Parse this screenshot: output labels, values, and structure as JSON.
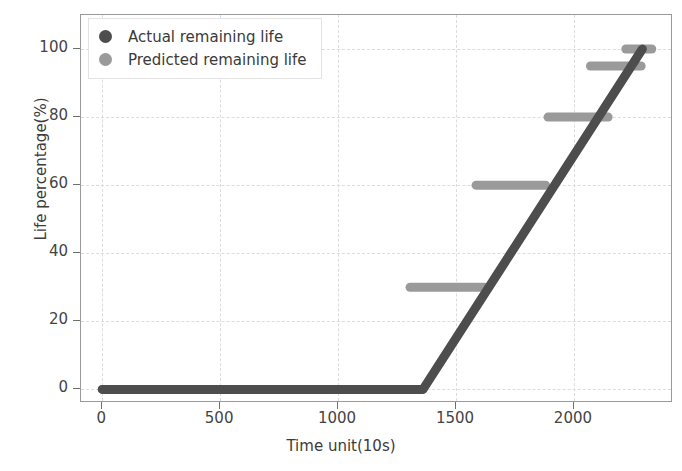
{
  "chart_data": {
    "type": "line",
    "title": "",
    "xlabel": "Time unit(10s)",
    "ylabel": "Life percentage(%)",
    "xlim": [
      -90,
      2420
    ],
    "ylim": [
      -4,
      110
    ],
    "xticks": [
      0,
      500,
      1000,
      1500,
      2000
    ],
    "yticks": [
      0,
      20,
      40,
      60,
      80,
      100
    ],
    "xtick_labels": [
      "0",
      "500",
      "1000",
      "1500",
      "2000"
    ],
    "ytick_labels": [
      "0",
      "20",
      "40",
      "60",
      "80",
      "100"
    ],
    "grid": true,
    "grid_style": "dashed",
    "legend_position": "upper left",
    "series": [
      {
        "name": "Actual remaining life",
        "color": "#4d4d4d",
        "marker": "circle",
        "linewidth": 9,
        "points": [
          {
            "x": 0,
            "y": 0
          },
          {
            "x": 1360,
            "y": 0
          },
          {
            "x": 2290,
            "y": 100
          }
        ]
      },
      {
        "name": "Predicted remaining life",
        "color": "#9a9a9a",
        "marker": "circle",
        "linewidth": 9,
        "steps": [
          {
            "x_start": 0,
            "x_end": 1360,
            "y": 0
          },
          {
            "x_start": 1305,
            "x_end": 1620,
            "y": 30
          },
          {
            "x_start": 1585,
            "x_end": 1880,
            "y": 60
          },
          {
            "x_start": 1890,
            "x_end": 2145,
            "y": 80
          },
          {
            "x_start": 2070,
            "x_end": 2285,
            "y": 95
          },
          {
            "x_start": 2220,
            "x_end": 2330,
            "y": 100
          }
        ]
      }
    ]
  },
  "legend": {
    "items": [
      {
        "label": "Actual remaining life",
        "color": "#4d4d4d"
      },
      {
        "label": "Predicted remaining life",
        "color": "#9a9a9a"
      }
    ]
  },
  "axes": {
    "x_axis_label": "Time unit(10s)",
    "y_axis_label": "Life percentage(%)"
  }
}
